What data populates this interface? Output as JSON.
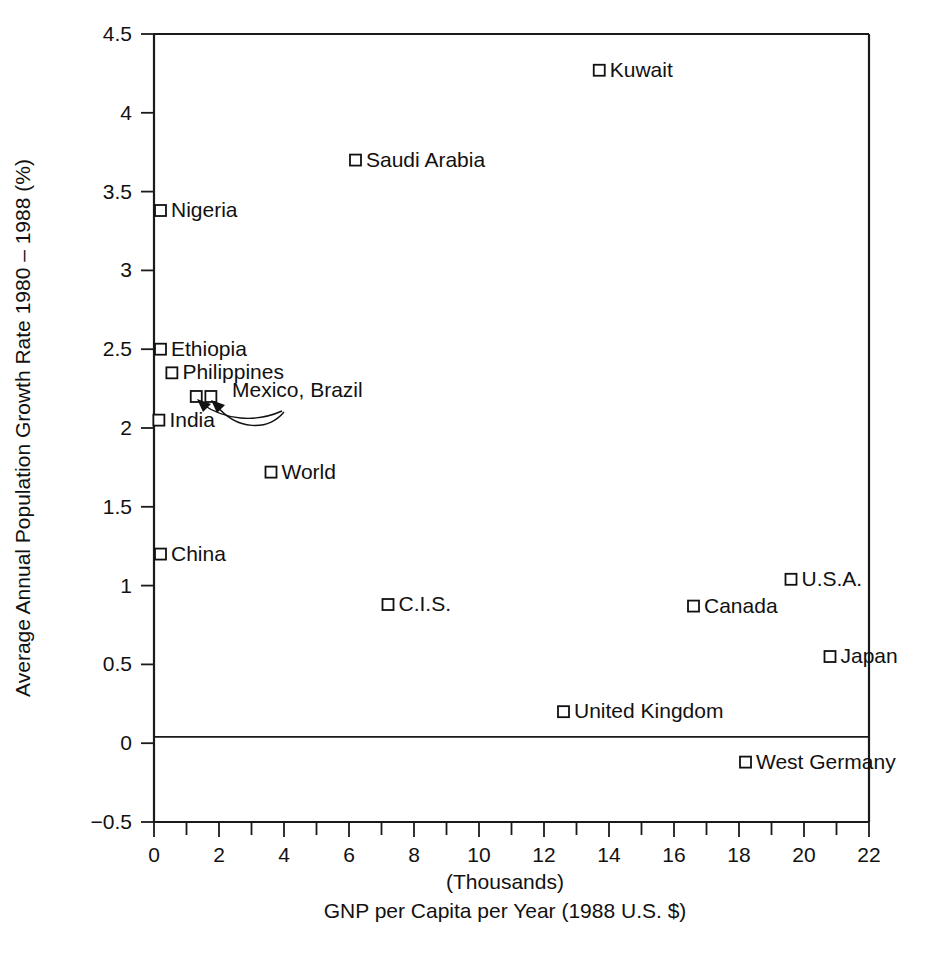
{
  "chart_data": {
    "type": "scatter",
    "title": "",
    "xlabel": "GNP per Capita per Year (1988 U.S. $)",
    "xlabel_units": "(Thousands)",
    "ylabel": "Average Annual Population Growth Rate 1980 – 1988 (%)",
    "xlim": [
      0,
      22
    ],
    "ylim": [
      -0.5,
      4.5
    ],
    "grid": false,
    "legend": "none",
    "xticks": [
      0,
      1,
      2,
      3,
      4,
      5,
      6,
      7,
      8,
      9,
      10,
      11,
      12,
      13,
      14,
      15,
      16,
      17,
      18,
      19,
      20,
      21,
      22
    ],
    "xtick_labels": [
      "0",
      "",
      "2",
      "",
      "4",
      "",
      "6",
      "",
      "8",
      "",
      "10",
      "",
      "12",
      "",
      "14",
      "",
      "16",
      "",
      "18",
      "",
      "20",
      "",
      "22"
    ],
    "yticks": [
      -0.5,
      0,
      0.5,
      1,
      1.5,
      2,
      2.5,
      3,
      3.5,
      4,
      4.5
    ],
    "ytick_labels": [
      "−0.5",
      "0",
      "0.5",
      "1",
      "1.5",
      "2",
      "2.5",
      "3",
      "3.5",
      "4",
      "4.5"
    ],
    "marker": "open-square",
    "reference_lines": [
      {
        "axis": "y",
        "value": 0
      }
    ],
    "points": [
      {
        "label": "Kuwait",
        "x": 13.7,
        "y": 4.27,
        "label_side": "right"
      },
      {
        "label": "Saudi Arabia",
        "x": 6.2,
        "y": 3.7,
        "label_side": "right"
      },
      {
        "label": "Nigeria",
        "x": 0.2,
        "y": 3.38,
        "label_side": "right"
      },
      {
        "label": "Ethiopia",
        "x": 0.2,
        "y": 2.5,
        "label_side": "right"
      },
      {
        "label": "Philippines",
        "x": 0.55,
        "y": 2.35,
        "label_side": "right"
      },
      {
        "label": "Mexico",
        "x": 1.3,
        "y": 2.2,
        "label_side": "annotated"
      },
      {
        "label": "Brazil",
        "x": 1.75,
        "y": 2.2,
        "label_side": "annotated"
      },
      {
        "label": "India",
        "x": 0.15,
        "y": 2.05,
        "label_side": "right"
      },
      {
        "label": "World",
        "x": 3.6,
        "y": 1.72,
        "label_side": "right"
      },
      {
        "label": "China",
        "x": 0.2,
        "y": 1.2,
        "label_side": "right"
      },
      {
        "label": "U.S.A.",
        "x": 19.6,
        "y": 1.04,
        "label_side": "right"
      },
      {
        "label": "C.I.S.",
        "x": 7.2,
        "y": 0.88,
        "label_side": "right"
      },
      {
        "label": "Canada",
        "x": 16.6,
        "y": 0.87,
        "label_side": "right"
      },
      {
        "label": "Japan",
        "x": 20.8,
        "y": 0.55,
        "label_side": "right"
      },
      {
        "label": "United Kingdom",
        "x": 12.6,
        "y": 0.2,
        "label_side": "right"
      },
      {
        "label": "West Germany",
        "x": 18.2,
        "y": -0.12,
        "label_side": "right"
      }
    ],
    "annotations": [
      {
        "text": "Mexico, Brazil",
        "points": [
          "Mexico",
          "Brazil"
        ],
        "style": "curved-double-arrow"
      }
    ]
  },
  "colors": {
    "ink": "#111111",
    "axis": "#1a1a1a",
    "background": "#ffffff",
    "marker_fill": "#ffffff"
  }
}
